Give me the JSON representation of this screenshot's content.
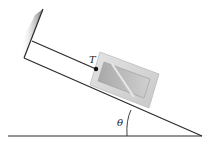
{
  "diagram": {
    "labels": {
      "tension": "T",
      "angle": "θ"
    },
    "colors": {
      "line": "#2a2a2a",
      "block_fill": "#d6d6d6",
      "block_inner": "#b8b8b8",
      "wall_shade": "#8a8a8a"
    }
  }
}
